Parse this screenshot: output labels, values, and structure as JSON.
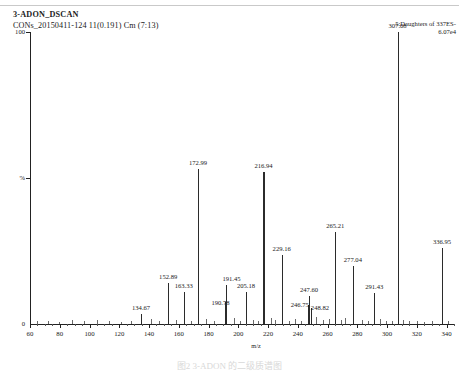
{
  "header": {
    "sample_name": "3-ADON_DSCAN",
    "run_info": "CONs_20150411-124 11(0.191) Cm (7:13)",
    "function_label": "5:Daughters of 337ES-",
    "intensity_label": "6.07e4"
  },
  "axes": {
    "y_top_label": "100",
    "y_mid_label": "%",
    "y_bottom_label": "0",
    "x_title": "m/z",
    "x_ticks": [
      "60",
      "80",
      "100",
      "120",
      "140",
      "160",
      "180",
      "200",
      "220",
      "240",
      "260",
      "280",
      "300",
      "320",
      "340"
    ]
  },
  "footer": {
    "caption": "图2 3-ADON 的二级质谱图"
  },
  "chart_data": {
    "type": "bar",
    "title": "3-ADON_DSCAN",
    "subtitle": "CONs_20150411-124 11(0.191) Cm (7:13)",
    "xlabel": "m/z",
    "ylabel": "%",
    "xlim": [
      60,
      345
    ],
    "ylim": [
      0,
      100
    ],
    "grid": false,
    "legend": "5:Daughters of 337ES-",
    "base_peak_intensity": "6.07e4",
    "x": [
      134.67,
      152.89,
      163.33,
      172.99,
      190.78,
      191.45,
      205.18,
      216.94,
      229.16,
      246.75,
      247.6,
      248.82,
      265.21,
      277.04,
      291.43,
      307.08,
      336.95
    ],
    "values": [
      3.5,
      14.0,
      11.0,
      53.0,
      7.5,
      13.5,
      11.0,
      52.0,
      23.5,
      6.5,
      9.5,
      5.5,
      31.5,
      20.0,
      10.5,
      100.0,
      26.0
    ],
    "labels": [
      "134.67",
      "152.89",
      "163.33",
      "172.99",
      "190.78",
      "191.45",
      "205.18",
      "216.94",
      "229.16",
      "246.75",
      "247.60",
      "248.82",
      "265.21",
      "277.04",
      "291.43",
      "307.08",
      "336.95"
    ],
    "minor_peaks_x": [
      64.5,
      72.0,
      79.5,
      88.0,
      96.0,
      105.0,
      113.0,
      121.0,
      128.0,
      141.0,
      147.0,
      158.0,
      168.0,
      178.0,
      184.0,
      197.0,
      201.0,
      210.0,
      213.0,
      222.0,
      225.0,
      234.0,
      238.0,
      242.0,
      252.0,
      257.0,
      261.0,
      269.0,
      272.0,
      283.0,
      287.0,
      295.0,
      299.0,
      303.0,
      311.0,
      315.0,
      320.0,
      325.0,
      330.0,
      341.0
    ],
    "minor_peaks_values": [
      0.9,
      1.1,
      0.8,
      1.3,
      0.9,
      1.5,
      1.0,
      0.8,
      1.2,
      1.6,
      1.0,
      1.4,
      1.1,
      1.8,
      0.9,
      2.0,
      1.2,
      1.5,
      1.0,
      2.2,
      1.3,
      1.1,
      1.6,
      1.2,
      2.4,
      1.5,
      1.8,
      1.3,
      2.0,
      1.4,
      1.1,
      1.6,
      1.2,
      1.0,
      1.3,
      0.9,
      1.1,
      0.8,
      1.0,
      0.9
    ]
  }
}
